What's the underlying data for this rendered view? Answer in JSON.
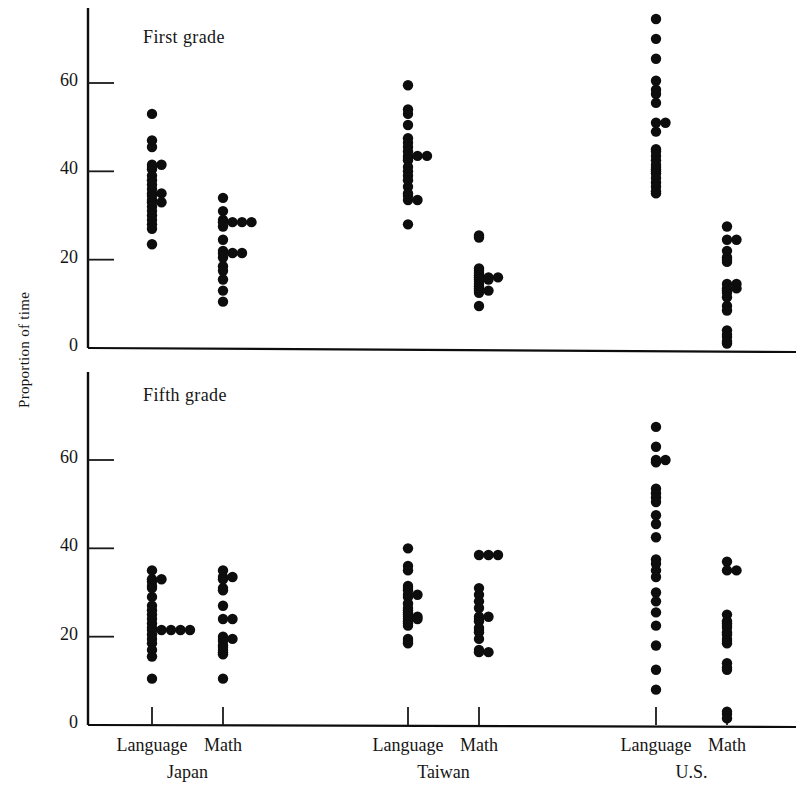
{
  "figure": {
    "y_axis_title": "Proportion of time",
    "panels": [
      {
        "key": "first",
        "label": "First grade"
      },
      {
        "key": "fifth",
        "label": "Fifth grade"
      }
    ],
    "y_ticks": [
      0,
      20,
      40,
      60
    ],
    "country_labels": [
      "Japan",
      "Taiwan",
      "U.S."
    ],
    "subject_labels": [
      "Language",
      "Math"
    ],
    "ink_color": "#0d0d0d"
  },
  "chart_data": {
    "type": "scatter",
    "title": "",
    "subtitle": "",
    "xlabel": "",
    "ylabel": "Proportion of time",
    "ylim": [
      0,
      75
    ],
    "grid": false,
    "legend": "none",
    "panels": [
      {
        "name": "First grade",
        "yticks": [
          0,
          20,
          40,
          60
        ],
        "columns": [
          {
            "country": "Japan",
            "subject": "Language",
            "values": [
              53,
              47,
              45.5,
              41.5,
              41.5,
              41,
              40.5,
              39,
              38,
              37,
              36,
              35,
              35,
              34.5,
              33.5,
              33,
              33,
              32,
              31,
              30,
              29,
              28,
              27,
              23.5
            ]
          },
          {
            "country": "Japan",
            "subject": "Math",
            "values": [
              34,
              31,
              29,
              28.5,
              28.5,
              28.5,
              28.5,
              27.5,
              24.5,
              22,
              21.5,
              21.5,
              21.5,
              20.5,
              18.5,
              17.5,
              15.5,
              13,
              10.5
            ]
          },
          {
            "country": "Taiwan",
            "subject": "Language",
            "values": [
              59.5,
              54,
              53,
              50.5,
              47.5,
              46.5,
              45.5,
              44.5,
              43.5,
              43.5,
              43.5,
              43,
              42.5,
              41,
              40,
              39,
              38,
              36.5,
              35,
              34.5,
              33.5,
              33.5,
              28
            ]
          },
          {
            "country": "Taiwan",
            "subject": "Math",
            "values": [
              25.5,
              25,
              18,
              17.5,
              17,
              16.5,
              16,
              16,
              16,
              15.5,
              15.5,
              15,
              14.5,
              14,
              13.5,
              13,
              13,
              12.5,
              9.5
            ]
          },
          {
            "country": "U.S.",
            "subject": "Language",
            "values": [
              74.5,
              70,
              65.5,
              60.5,
              58.5,
              57.5,
              55.5,
              51,
              51,
              49,
              45,
              44.5,
              43.5,
              42.5,
              41.5,
              41,
              40.5,
              40,
              39.5,
              38.5,
              37.5,
              36.5,
              35.5,
              35
            ]
          },
          {
            "country": "U.S.",
            "subject": "Math",
            "values": [
              27.5,
              24.5,
              24.5,
              22,
              20.5,
              20,
              19.5,
              14.5,
              14.5,
              13.5,
              13.5,
              13,
              12.5,
              11.5,
              9.5,
              8.5,
              4,
              3,
              2.5,
              1.5,
              1
            ]
          }
        ]
      },
      {
        "name": "Fifth grade",
        "yticks": [
          0,
          20,
          40,
          60
        ],
        "columns": [
          {
            "country": "Japan",
            "subject": "Language",
            "values": [
              35,
              33,
              33,
              32.5,
              31.5,
              31,
              29,
              27,
              26,
              25,
              24,
              23,
              22,
              21.5,
              21.5,
              21.5,
              21.5,
              21.5,
              20.5,
              19.5,
              18.5,
              17,
              15.5,
              10.5
            ]
          },
          {
            "country": "Japan",
            "subject": "Math",
            "values": [
              35,
              33.5,
              33.5,
              33,
              31,
              30.5,
              27,
              24,
              24,
              20,
              19.5,
              19.5,
              19,
              18,
              17.5,
              17,
              16.5,
              16,
              10.5
            ]
          },
          {
            "country": "Taiwan",
            "subject": "Language",
            "values": [
              40,
              36,
              35,
              31.5,
              31,
              30.5,
              29.5,
              29.5,
              29,
              27.5,
              26.5,
              26,
              25.5,
              25,
              24.5,
              24.5,
              24,
              24,
              23.5,
              23,
              22.5,
              19.5,
              19,
              18.5
            ]
          },
          {
            "country": "Taiwan",
            "subject": "Math",
            "values": [
              38.5,
              38.5,
              38.5,
              31,
              29.5,
              28,
              26.5,
              24.5,
              24.5,
              24,
              23.5,
              22,
              21.5,
              21,
              19.5,
              17,
              16.5,
              16.5
            ]
          },
          {
            "country": "U.S.",
            "subject": "Language",
            "values": [
              67.5,
              63,
              60,
              60,
              59.5,
              53.5,
              52.5,
              51.5,
              50.5,
              47.5,
              45.5,
              42.5,
              37.5,
              36.5,
              35,
              33.5,
              30,
              28,
              25.5,
              22.5,
              18,
              12.5,
              8
            ]
          },
          {
            "country": "U.S.",
            "subject": "Math",
            "values": [
              37,
              35,
              35,
              25,
              23.5,
              23,
              22.5,
              22,
              21,
              20.5,
              19.5,
              19,
              18.5,
              14,
              13,
              12.5,
              3,
              2.5,
              1.5
            ]
          }
        ]
      }
    ]
  }
}
